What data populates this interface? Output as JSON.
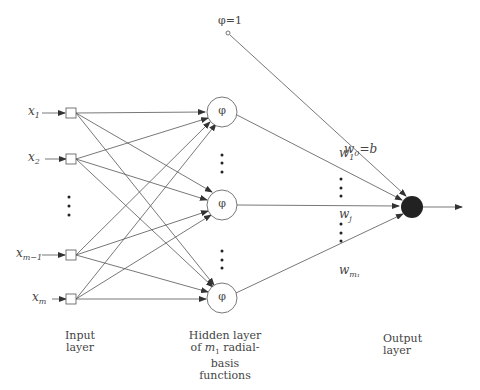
{
  "diagram": {
    "inputs": [
      {
        "var": "x",
        "sub": "1"
      },
      {
        "var": "x",
        "sub": "2"
      },
      {
        "var": "x",
        "sub": "m−1"
      },
      {
        "var": "x",
        "sub": "m"
      }
    ],
    "hidden_symbol": "φ",
    "bias_label": "φ=1",
    "weights": [
      {
        "var": "w",
        "sub": "0",
        "suffix": "=b"
      },
      {
        "var": "w",
        "sub": "1",
        "suffix": ""
      },
      {
        "var": "w",
        "sub": "j",
        "suffix": ""
      },
      {
        "var": "w",
        "sub": "m₁",
        "suffix": ""
      }
    ],
    "labels": {
      "input_layer_1": "Input",
      "input_layer_2": "layer",
      "hidden_layer_1": "Hidden layer",
      "hidden_layer_2a": "of ",
      "hidden_layer_2m": "m",
      "hidden_layer_2sub": "1",
      "hidden_layer_2b": " radial-",
      "hidden_layer_3": "basis",
      "hidden_layer_4": "functions",
      "output_layer_1": "Output",
      "output_layer_2": "layer"
    }
  }
}
